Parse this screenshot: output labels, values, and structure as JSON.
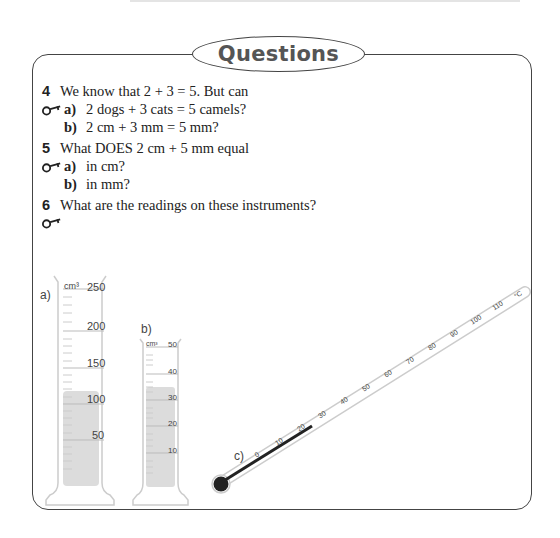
{
  "header": {
    "title": "Questions"
  },
  "questions": [
    {
      "number": "4",
      "text": "We know that 2 + 3 = 5. But can",
      "parts": [
        {
          "label": "a)",
          "text": "2 dogs + 3 cats = 5 camels?",
          "key_icon": true
        },
        {
          "label": "b)",
          "text": "2 cm + 3 mm = 5 mm?",
          "key_icon": false
        }
      ]
    },
    {
      "number": "5",
      "text": "What DOES 2 cm + 5 mm equal",
      "parts": [
        {
          "label": "a)",
          "text": "in cm?",
          "key_icon": true
        },
        {
          "label": "b)",
          "text": "in mm?",
          "key_icon": false
        }
      ]
    },
    {
      "number": "6",
      "text": "What are the readings on these instruments?",
      "key_icon": true
    }
  ],
  "instruments": {
    "cylinder_a": {
      "label": "a)",
      "unit": "cm³",
      "scale": [
        "250",
        "200",
        "150",
        "100",
        "50"
      ]
    },
    "cylinder_b": {
      "label": "b)",
      "unit": "cm³",
      "scale": [
        "50",
        "40",
        "30",
        "20",
        "10"
      ]
    },
    "thermometer_c": {
      "label": "c)",
      "unit": "°C",
      "scale": [
        "0",
        "10",
        "20",
        "30",
        "40",
        "50",
        "60",
        "70",
        "80",
        "90",
        "100",
        "110"
      ]
    }
  },
  "colors": {
    "border": "#444444",
    "title_text": "#555555",
    "liquid": "#d9d9d9"
  }
}
